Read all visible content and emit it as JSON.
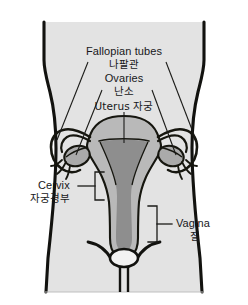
{
  "figure": {
    "title_visible": false,
    "type": "anatomical-diagram",
    "colors": {
      "page_background": "#ffffff",
      "body_fill": "#e3e3e3",
      "body_outline": "#12120f",
      "organ_fill": "#b9b9b9",
      "organ_cavity_fill": "#8e8e8e",
      "ovary_fill": "#aaaaaa",
      "organ_outline": "#16160f",
      "label_text": "#17171a",
      "leader_line": "#1b1b18"
    }
  },
  "labels": {
    "fallopian_tubes": {
      "en": "Fallopian tubes",
      "ko": "나팔관"
    },
    "ovaries": {
      "en": "Ovaries",
      "ko": "난소"
    },
    "uterus": {
      "en": "Uterus 자궁"
    },
    "cervix": {
      "en": "Cervix",
      "ko": "자궁경부"
    },
    "vagina": {
      "en": "Vagina",
      "ko": "질"
    }
  },
  "annotations": {
    "leader_lines": [
      {
        "name": "fallopian-tube-left-leader",
        "from": [
          88,
          62
        ],
        "to": [
          57,
          140
        ]
      },
      {
        "name": "fallopian-tube-right-leader",
        "from": [
          166,
          62
        ],
        "to": [
          196,
          140
        ]
      },
      {
        "name": "ovary-left-leader",
        "from": [
          102,
          88
        ],
        "to": [
          76,
          155
        ]
      },
      {
        "name": "ovary-right-leader",
        "from": [
          152,
          88
        ],
        "to": [
          176,
          155
        ]
      },
      {
        "name": "uterus-leader",
        "from": [
          124,
          110
        ],
        "to": [
          124,
          142
        ]
      }
    ],
    "brackets": [
      {
        "name": "cervix-bracket",
        "orientation": "opens-right",
        "x": 95,
        "y_top": 172,
        "y_bottom": 200
      },
      {
        "name": "vagina-bracket",
        "orientation": "opens-left",
        "x": 157,
        "y_top": 206,
        "y_bottom": 242
      }
    ]
  }
}
